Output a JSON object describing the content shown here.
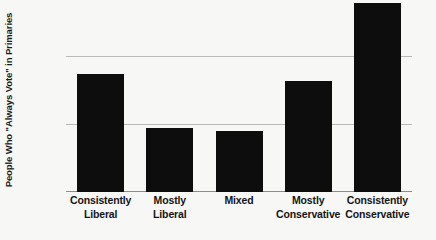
{
  "chart_data": {
    "type": "bar",
    "title": "",
    "xlabel": "",
    "ylabel": "People Who \"Always Vote\" in Primaries",
    "categories": [
      "Consistently Liberal",
      "Mostly Liberal",
      "Mixed",
      "Mostly Conservative",
      "Consistently Conservative"
    ],
    "category_lines": [
      [
        "Consistently",
        "Liberal"
      ],
      [
        "Mostly",
        "Liberal"
      ],
      [
        "Mixed",
        ""
      ],
      [
        "Mostly",
        "Conservative"
      ],
      [
        "Consistently",
        "Conservative"
      ]
    ],
    "values": [
      35,
      19,
      18,
      33,
      56
    ],
    "value_labels": [
      "35%",
      "19%",
      "18%",
      "33%",
      "56%"
    ],
    "ylim": [
      0,
      57
    ],
    "yticks": [
      0,
      20,
      40
    ],
    "ytick_labels": [
      "0",
      "20%",
      "40%"
    ],
    "grid": true,
    "legend": "none",
    "bar_color": "#0d0d0d",
    "background_color": "#f7f7f5",
    "gridline_color": "#b9b9b6",
    "axis_color": "#8d8d8a"
  }
}
